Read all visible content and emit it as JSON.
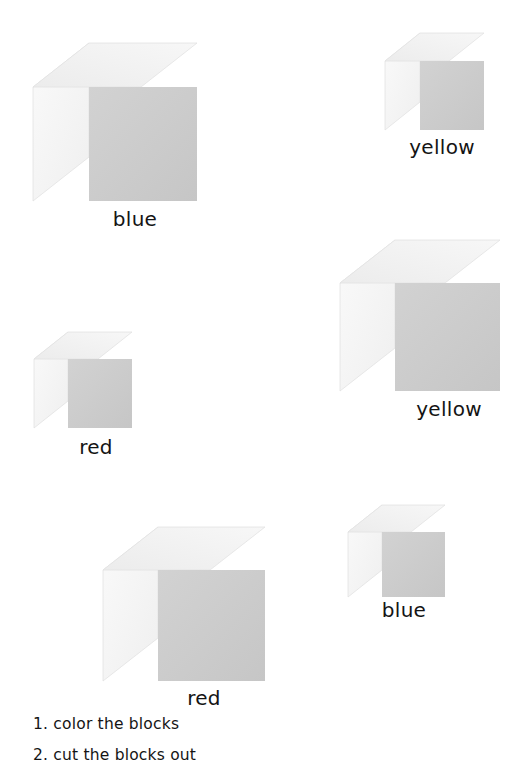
{
  "page": {
    "background": "#ffffff",
    "width": 530,
    "height": 769
  },
  "palette": {
    "top_face": "#f1f1f1",
    "left_face": "#f6f6f6",
    "right_face": "#cdcdcd",
    "edge": "#e2e2e2",
    "text": "#141414"
  },
  "blocks": [
    {
      "id": "block-1",
      "label": "blue",
      "size": "large",
      "x": 33,
      "y": 43,
      "width": 164,
      "height": 158,
      "depth_x": 56,
      "depth_y": 44,
      "label_x": 104,
      "label_y": 209,
      "label_w": 62
    },
    {
      "id": "block-2",
      "label": "yellow",
      "size": "small",
      "x": 385,
      "y": 33,
      "width": 99,
      "height": 97,
      "depth_x": 35,
      "depth_y": 28,
      "label_x": 403,
      "label_y": 137,
      "label_w": 78
    },
    {
      "id": "block-3",
      "label": "yellow",
      "size": "medium",
      "x": 340,
      "y": 240,
      "width": 160,
      "height": 151,
      "depth_x": 55,
      "depth_y": 43,
      "label_x": 410,
      "label_y": 399,
      "label_w": 78
    },
    {
      "id": "block-4",
      "label": "red",
      "size": "small",
      "x": 34,
      "y": 332,
      "width": 98,
      "height": 96,
      "depth_x": 34,
      "depth_y": 27,
      "label_x": 72,
      "label_y": 437,
      "label_w": 48
    },
    {
      "id": "block-5",
      "label": "red",
      "size": "large",
      "x": 103,
      "y": 527,
      "width": 162,
      "height": 154,
      "depth_x": 55,
      "depth_y": 43,
      "label_x": 180,
      "label_y": 688,
      "label_w": 48
    },
    {
      "id": "block-6",
      "label": "blue",
      "size": "small",
      "x": 348,
      "y": 505,
      "width": 97,
      "height": 92,
      "depth_x": 34,
      "depth_y": 27,
      "label_x": 373,
      "label_y": 600,
      "label_w": 62
    }
  ],
  "instructions": [
    "1. color the blocks",
    "2. cut the blocks out"
  ]
}
